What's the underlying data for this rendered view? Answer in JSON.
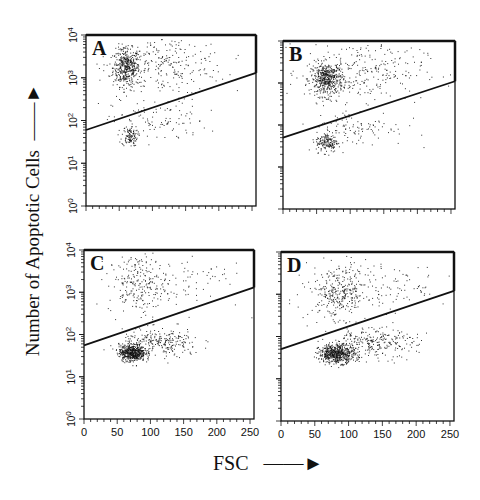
{
  "figure": {
    "ylabel": "Number of Apoptotic Cells",
    "xlabel": "FSC",
    "ink_color": "#111111",
    "background": "#ffffff"
  },
  "chart_data": [
    {
      "type": "scatter",
      "panel": "A",
      "title": "A",
      "xlabel": "FSC",
      "ylabel": "Number of Apoptotic Cells",
      "xlim": [
        0,
        256
      ],
      "ylim_log10": [
        0,
        4
      ],
      "x_ticks": [],
      "y_tick_labels": [
        "10^0",
        "10^1",
        "10^2",
        "10^3",
        "10^4"
      ],
      "show_y_labels": true,
      "show_x_labels": false,
      "gate_line": {
        "x": [
          0,
          256
        ],
        "y": [
          60,
          1300
        ]
      },
      "clusters": [
        {
          "name": "apoptotic-upper",
          "cx": 60,
          "cy_log": 3.25,
          "sx": 10,
          "sy": 0.22,
          "n": 420
        },
        {
          "name": "upper-spread",
          "cx": 120,
          "cy_log": 3.3,
          "sx": 45,
          "sy": 0.35,
          "n": 260
        },
        {
          "name": "lower-dense",
          "cx": 65,
          "cy_log": 1.65,
          "sx": 6,
          "sy": 0.12,
          "n": 110
        },
        {
          "name": "lower-spread",
          "cx": 110,
          "cy_log": 2.0,
          "sx": 35,
          "sy": 0.25,
          "n": 100
        }
      ]
    },
    {
      "type": "scatter",
      "panel": "B",
      "title": "B",
      "xlabel": "FSC",
      "ylabel": "Number of Apoptotic Cells",
      "xlim": [
        0,
        256
      ],
      "ylim_log10": [
        0,
        4
      ],
      "show_y_labels": false,
      "show_x_labels": false,
      "gate_line": {
        "x": [
          0,
          256
        ],
        "y": [
          50,
          1100
        ]
      },
      "clusters": [
        {
          "name": "apoptotic-upper",
          "cx": 65,
          "cy_log": 3.1,
          "sx": 12,
          "sy": 0.2,
          "n": 480
        },
        {
          "name": "upper-spread",
          "cx": 120,
          "cy_log": 3.3,
          "sx": 45,
          "sy": 0.35,
          "n": 260
        },
        {
          "name": "lower-dense",
          "cx": 65,
          "cy_log": 1.6,
          "sx": 8,
          "sy": 0.12,
          "n": 150
        },
        {
          "name": "lower-spread",
          "cx": 110,
          "cy_log": 1.95,
          "sx": 35,
          "sy": 0.22,
          "n": 110
        }
      ]
    },
    {
      "type": "scatter",
      "panel": "C",
      "title": "C",
      "xlabel": "FSC",
      "ylabel": "Number of Apoptotic Cells",
      "xlim": [
        0,
        256
      ],
      "ylim_log10": [
        0,
        4
      ],
      "x_ticks": [
        0,
        50,
        100,
        150,
        200,
        250
      ],
      "y_tick_labels": [
        "10^0",
        "10^1",
        "10^2",
        "10^3",
        "10^4"
      ],
      "show_y_labels": true,
      "show_x_labels": true,
      "gate_line": {
        "x": [
          0,
          256
        ],
        "y": [
          55,
          1300
        ]
      },
      "clusters": [
        {
          "name": "upper",
          "cx": 80,
          "cy_log": 3.2,
          "sx": 22,
          "sy": 0.35,
          "n": 230
        },
        {
          "name": "upper-spread",
          "cx": 150,
          "cy_log": 3.3,
          "sx": 45,
          "sy": 0.35,
          "n": 80
        },
        {
          "name": "lower-dense",
          "cx": 72,
          "cy_log": 1.58,
          "sx": 10,
          "sy": 0.1,
          "n": 520
        },
        {
          "name": "lower-spread",
          "cx": 115,
          "cy_log": 1.8,
          "sx": 30,
          "sy": 0.17,
          "n": 260
        }
      ]
    },
    {
      "type": "scatter",
      "panel": "D",
      "title": "D",
      "xlabel": "FSC",
      "ylabel": "Number of Apoptotic Cells",
      "xlim": [
        0,
        256
      ],
      "ylim_log10": [
        0,
        4
      ],
      "x_ticks": [
        0,
        50,
        100,
        150,
        200,
        250
      ],
      "show_y_labels": false,
      "show_x_labels": true,
      "gate_line": {
        "x": [
          0,
          256
        ],
        "y": [
          50,
          1200
        ]
      },
      "clusters": [
        {
          "name": "upper",
          "cx": 85,
          "cy_log": 3.05,
          "sx": 22,
          "sy": 0.3,
          "n": 300
        },
        {
          "name": "upper-spread",
          "cx": 150,
          "cy_log": 3.2,
          "sx": 50,
          "sy": 0.35,
          "n": 120
        },
        {
          "name": "lower-dense",
          "cx": 82,
          "cy_log": 1.6,
          "sx": 13,
          "sy": 0.11,
          "n": 560
        },
        {
          "name": "lower-spread",
          "cx": 130,
          "cy_log": 1.85,
          "sx": 35,
          "sy": 0.18,
          "n": 280
        }
      ]
    }
  ],
  "layout": {
    "panels": [
      {
        "left": 86,
        "top": 35,
        "right": 256,
        "bottom": 206
      },
      {
        "left": 283,
        "top": 41,
        "right": 455,
        "bottom": 209
      },
      {
        "left": 84,
        "top": 250,
        "right": 254,
        "bottom": 419
      },
      {
        "left": 281,
        "top": 252,
        "right": 454,
        "bottom": 421
      }
    ]
  }
}
